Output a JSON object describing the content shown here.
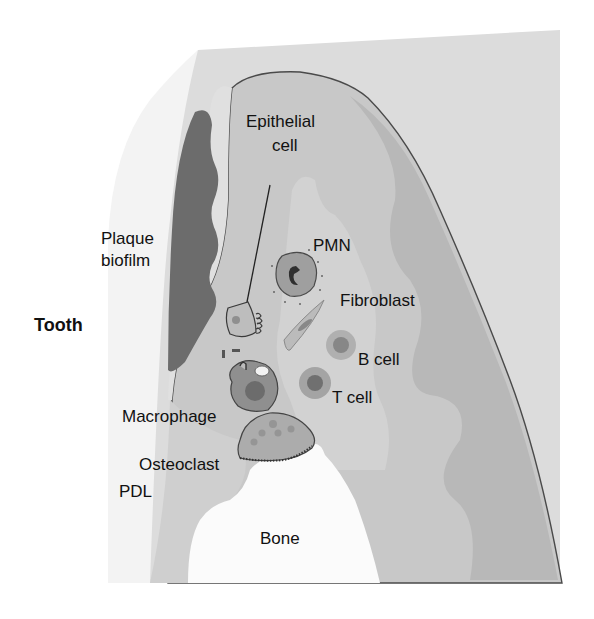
{
  "figure": {
    "colors": {
      "background": "#ffffff",
      "tooth": "#f4f4f4",
      "gingiva_outer": "#dadada",
      "connective_tissue": "#c6c6c6",
      "ct_dark_band": "#b6b6b6",
      "ct_light_patch": "#d4d4d4",
      "plaque": "#6e6e6e",
      "outline": "#4a4a4a",
      "bone": "#fbfbfb"
    }
  },
  "labels": {
    "tooth": "Tooth",
    "plaque_line1": "Plaque",
    "plaque_line2": "biofilm",
    "epithelial_line1": "Epithelial",
    "epithelial_line2": "cell",
    "pmn": "PMN",
    "fibroblast": "Fibroblast",
    "b_cell": "B cell",
    "t_cell": "T cell",
    "macrophage": "Macrophage",
    "osteoclast": "Osteoclast",
    "pdl": "PDL",
    "bone": "Bone"
  }
}
